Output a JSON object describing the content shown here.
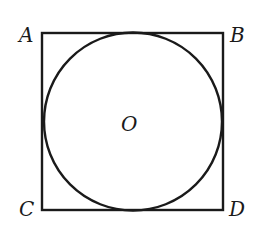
{
  "diagram": {
    "square": {
      "x": 42,
      "y": 33,
      "width": 181,
      "height": 177,
      "stroke": "#1a1a1a"
    },
    "circle": {
      "cx": 133,
      "cy": 121,
      "r": 89,
      "stroke": "#1a1a1a"
    },
    "labels": {
      "A": "A",
      "B": "B",
      "C": "C",
      "D": "D",
      "O": "O"
    }
  }
}
